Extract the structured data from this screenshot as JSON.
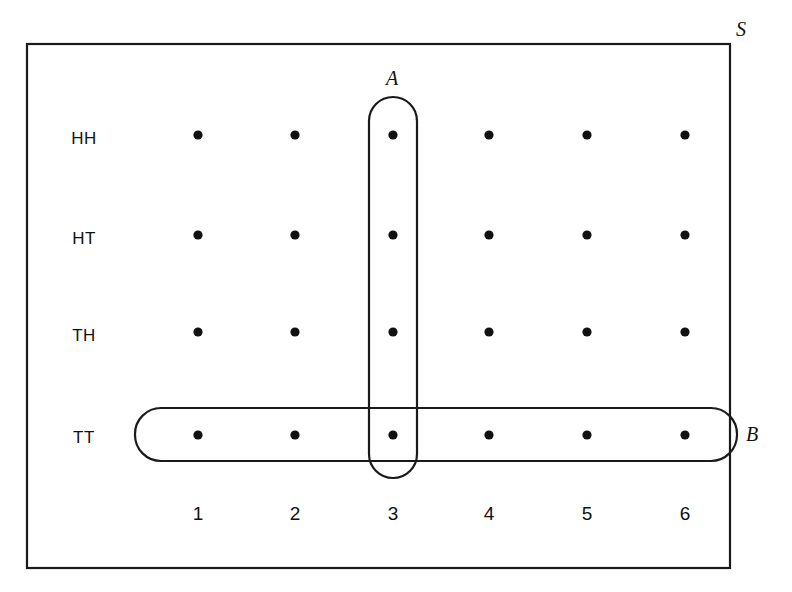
{
  "figure": {
    "universe_label": "S",
    "row_header_title": "Coin outcomes",
    "column_header_title": "Die outcome",
    "row_labels": [
      "HH",
      "HT",
      "TH",
      "TT"
    ],
    "column_labels": [
      "1",
      "2",
      "3",
      "4",
      "5",
      "6"
    ],
    "sets": [
      {
        "name": "A",
        "label": "A",
        "shape": "vertical-rounded-oval",
        "covers_description": "column 3, all four coin rows"
      },
      {
        "name": "B",
        "label": "B",
        "shape": "horizontal-rounded-oval",
        "covers_description": "row TT, all six die columns"
      }
    ],
    "colors": {
      "stroke": "#1a1a1a",
      "background": "#ffffff",
      "dot": "#111111"
    }
  },
  "chart_data": {
    "type": "scatter",
    "xlabel": "",
    "ylabel": "",
    "x": [
      "1",
      "2",
      "3",
      "4",
      "5",
      "6"
    ],
    "categories": [
      "1",
      "2",
      "3",
      "4",
      "5",
      "6"
    ],
    "y_categories": [
      "HH",
      "HT",
      "TH",
      "TT"
    ],
    "grid": false,
    "legend": "none",
    "points": [
      {
        "x": "1",
        "y": "HH",
        "in_A": false,
        "in_B": false
      },
      {
        "x": "2",
        "y": "HH",
        "in_A": false,
        "in_B": false
      },
      {
        "x": "3",
        "y": "HH",
        "in_A": true,
        "in_B": false
      },
      {
        "x": "4",
        "y": "HH",
        "in_A": false,
        "in_B": false
      },
      {
        "x": "5",
        "y": "HH",
        "in_A": false,
        "in_B": false
      },
      {
        "x": "6",
        "y": "HH",
        "in_A": false,
        "in_B": false
      },
      {
        "x": "1",
        "y": "HT",
        "in_A": false,
        "in_B": false
      },
      {
        "x": "2",
        "y": "HT",
        "in_A": false,
        "in_B": false
      },
      {
        "x": "3",
        "y": "HT",
        "in_A": true,
        "in_B": false
      },
      {
        "x": "4",
        "y": "HT",
        "in_A": false,
        "in_B": false
      },
      {
        "x": "5",
        "y": "HT",
        "in_A": false,
        "in_B": false
      },
      {
        "x": "6",
        "y": "HT",
        "in_A": false,
        "in_B": false
      },
      {
        "x": "1",
        "y": "TH",
        "in_A": false,
        "in_B": false
      },
      {
        "x": "2",
        "y": "TH",
        "in_A": false,
        "in_B": false
      },
      {
        "x": "3",
        "y": "TH",
        "in_A": true,
        "in_B": false
      },
      {
        "x": "4",
        "y": "TH",
        "in_A": false,
        "in_B": false
      },
      {
        "x": "5",
        "y": "TH",
        "in_A": false,
        "in_B": false
      },
      {
        "x": "6",
        "y": "TH",
        "in_A": false,
        "in_B": false
      },
      {
        "x": "1",
        "y": "TT",
        "in_A": false,
        "in_B": true
      },
      {
        "x": "2",
        "y": "TT",
        "in_A": false,
        "in_B": true
      },
      {
        "x": "3",
        "y": "TT",
        "in_A": true,
        "in_B": true
      },
      {
        "x": "4",
        "y": "TT",
        "in_A": false,
        "in_B": true
      },
      {
        "x": "5",
        "y": "TT",
        "in_A": false,
        "in_B": true
      },
      {
        "x": "6",
        "y": "TT",
        "in_A": false,
        "in_B": true
      }
    ],
    "annotations": [
      {
        "text": "S",
        "role": "universe-label"
      },
      {
        "text": "A",
        "role": "set-label"
      },
      {
        "text": "B",
        "role": "set-label"
      }
    ]
  },
  "geometry": {
    "columns_x": [
      198,
      295,
      393,
      489,
      587,
      685
    ],
    "rows_y": [
      135,
      235,
      332,
      435
    ],
    "row_label_x": 84,
    "col_label_y": 513,
    "dot_radius": 4.6,
    "universe_rect": {
      "x": 27,
      "y": 44,
      "w": 703,
      "h": 524
    },
    "set_a_rect": {
      "x": 369,
      "y": 97,
      "w": 48,
      "h": 381,
      "rx": 24
    },
    "set_b_rect": {
      "x": 135,
      "y": 408,
      "w": 602,
      "h": 53,
      "rx": 26
    },
    "label_s": {
      "x": 741,
      "y": 29
    },
    "label_a": {
      "x": 392,
      "y": 78
    },
    "label_b": {
      "x": 752,
      "y": 434
    }
  }
}
